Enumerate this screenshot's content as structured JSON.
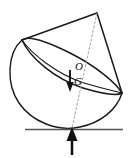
{
  "figure": {
    "type": "mechanics-free-body-diagram",
    "background_color": "#ffffff",
    "stroke_color": "#1a1a1a",
    "dashed_color": "#8a8a8a",
    "ground_color": "#555555",
    "labels": {
      "center": "O",
      "weight": "G"
    },
    "geometry": {
      "canvas": {
        "width": 129,
        "height": 158
      },
      "cone_apex": {
        "x": 97,
        "y": 13
      },
      "base_left": {
        "x": 22,
        "y": 40
      },
      "base_right": {
        "x": 122,
        "y": 93
      },
      "center_point": {
        "x": 72,
        "y": 66
      },
      "contact_point": {
        "x": 72,
        "y": 128
      },
      "ground_line": {
        "x1": 25,
        "x2": 123,
        "y": 129
      },
      "base_ellipse": {
        "cx": 72,
        "cy": 66.5,
        "rx": 57,
        "ry": 15,
        "rotation_deg": 28
      },
      "hemisphere_radius": 56,
      "tilt_deg": 28
    },
    "vectors": {
      "weight_arrow": {
        "name": "G",
        "direction": "down",
        "x": 70,
        "y_start": 71,
        "y_end": 91
      },
      "reaction_arrow": {
        "name": "normal-reaction",
        "direction": "up",
        "x": 72,
        "y_start": 155,
        "y_end": 128
      }
    }
  }
}
